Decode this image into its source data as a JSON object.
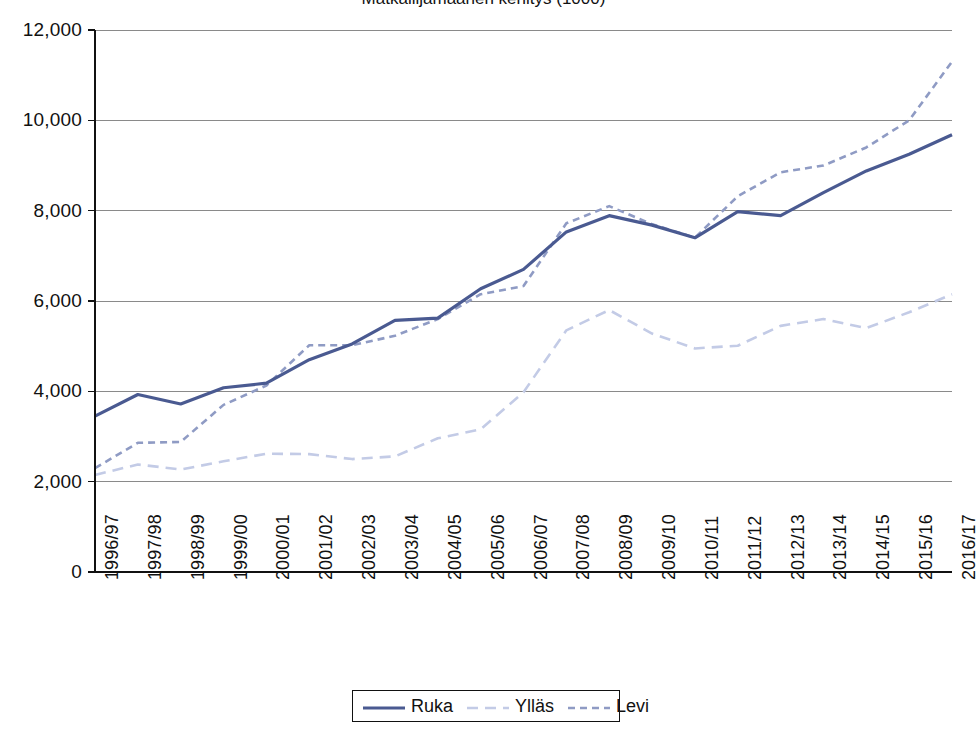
{
  "title_clipped": "Matkailijamäärien kehitys (1000)",
  "legend": {
    "position": "bottom-center",
    "items": [
      {
        "label": "Ruka",
        "color": "#4a5a91",
        "style": "solid"
      },
      {
        "label": "Ylläs",
        "color": "#c3cbe6",
        "style": "dashed-long"
      },
      {
        "label": "Levi",
        "color": "#8f9bc4",
        "style": "dashed-short"
      }
    ]
  },
  "chart_data": {
    "type": "line",
    "title": "",
    "xlabel": "",
    "ylabel": "",
    "ylim": [
      0,
      12000
    ],
    "ytick_step": 2000,
    "ytick_labels": [
      "0",
      "2,000",
      "4,000",
      "6,000",
      "8,000",
      "10,000",
      "12,000"
    ],
    "ytick_values": [
      0,
      2000,
      4000,
      6000,
      8000,
      10000,
      12000
    ],
    "grid": true,
    "categories": [
      "1996/97",
      "1997/98",
      "1998/99",
      "1999/00",
      "2000/01",
      "2001/02",
      "2002/03",
      "2003/04",
      "2004/05",
      "2005/06",
      "2006/07",
      "2007/08",
      "2008/09",
      "2009/10",
      "2010/11",
      "2011/12",
      "2012/13",
      "2013/14",
      "2014/15",
      "2015/16",
      "2016/17"
    ],
    "series": [
      {
        "name": "Ruka",
        "color": "#4a5a91",
        "style": "solid",
        "values": [
          3450,
          3930,
          3720,
          4080,
          4180,
          4700,
          5050,
          5570,
          5620,
          6270,
          6700,
          7530,
          7890,
          7680,
          7400,
          7980,
          7890,
          8400,
          8880,
          9250,
          9680
        ]
      },
      {
        "name": "Ylläs",
        "color": "#c3cbe6",
        "style": "dashed-long",
        "values": [
          2150,
          2380,
          2270,
          2450,
          2620,
          2610,
          2500,
          2560,
          2960,
          3160,
          3980,
          5350,
          5800,
          5280,
          4950,
          5010,
          5450,
          5600,
          5400,
          5750,
          6150
        ]
      },
      {
        "name": "Levi",
        "color": "#8f9bc4",
        "style": "dashed-short",
        "values": [
          2300,
          2860,
          2880,
          3700,
          4130,
          5020,
          5020,
          5230,
          5600,
          6150,
          6330,
          7720,
          8100,
          7700,
          7400,
          8320,
          8850,
          9000,
          9400,
          10000,
          11300
        ]
      }
    ]
  },
  "axes": {
    "y_axis_name": "value-axis",
    "x_axis_name": "category-axis"
  }
}
